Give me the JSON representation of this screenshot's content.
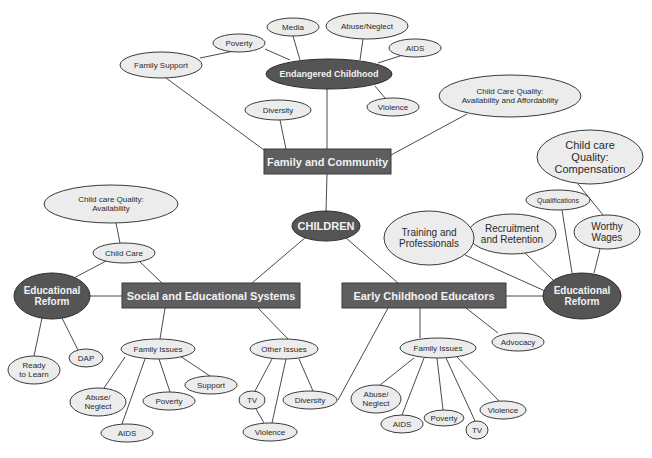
{
  "colors": {
    "background": "#ffffff",
    "light_node_fill": "#ececec",
    "dark_node_fill": "#555556",
    "box_fill": "#5e5e60",
    "edge": "#4a4a4a"
  },
  "nodes": [
    {
      "id": "children",
      "lines": [
        "CHILDREN"
      ],
      "shape": "ellipse-dark",
      "cx": 326,
      "cy": 226,
      "rx": 34,
      "ry": 15,
      "fs": 11
    },
    {
      "id": "family_community",
      "lines": [
        "Family and Community"
      ],
      "shape": "box",
      "x": 264,
      "y": 149,
      "w": 127,
      "h": 25,
      "fs": 11
    },
    {
      "id": "social_edu",
      "lines": [
        "Social and Educational Systems"
      ],
      "shape": "box",
      "x": 122,
      "y": 283,
      "w": 178,
      "h": 25,
      "fs": 11
    },
    {
      "id": "ecе",
      "lines": [
        "Early Childhood Educators"
      ],
      "shape": "box",
      "x": 342,
      "y": 283,
      "w": 164,
      "h": 25,
      "fs": 11
    },
    {
      "id": "endangered",
      "lines": [
        "Endangered Childhood"
      ],
      "shape": "ellipse-dark",
      "cx": 329,
      "cy": 74,
      "rx": 63,
      "ry": 15,
      "fs": 9
    },
    {
      "id": "media",
      "lines": [
        "Media"
      ],
      "shape": "ellipse-light",
      "cx": 293,
      "cy": 27,
      "rx": 26,
      "ry": 9,
      "fs": 8
    },
    {
      "id": "abuse_top",
      "lines": [
        "Abuse/Neglect"
      ],
      "shape": "ellipse-light",
      "cx": 367,
      "cy": 26,
      "rx": 41,
      "ry": 13,
      "fs": 8
    },
    {
      "id": "aids_top",
      "lines": [
        "AIDS"
      ],
      "shape": "ellipse-light",
      "cx": 415,
      "cy": 48,
      "rx": 26,
      "ry": 9,
      "fs": 8
    },
    {
      "id": "poverty_top",
      "lines": [
        "Poverty"
      ],
      "shape": "ellipse-light",
      "cx": 239,
      "cy": 43,
      "rx": 26,
      "ry": 9,
      "fs": 8
    },
    {
      "id": "family_support",
      "lines": [
        "Family Support"
      ],
      "shape": "ellipse-light",
      "cx": 161,
      "cy": 65,
      "rx": 41,
      "ry": 13,
      "fs": 8
    },
    {
      "id": "violence_top",
      "lines": [
        "Violence"
      ],
      "shape": "ellipse-light",
      "cx": 393,
      "cy": 107,
      "rx": 26,
      "ry": 9,
      "fs": 8
    },
    {
      "id": "diversity_top",
      "lines": [
        "Diversity"
      ],
      "shape": "ellipse-light",
      "cx": 278,
      "cy": 110,
      "rx": 33,
      "ry": 10,
      "fs": 8
    },
    {
      "id": "ccq_afford",
      "lines": [
        "Child Care Quality:",
        "Availability and Affordability"
      ],
      "shape": "ellipse-light",
      "cx": 510,
      "cy": 96,
      "rx": 71,
      "ry": 21,
      "fs": 8
    },
    {
      "id": "ccq_comp",
      "lines": [
        "Child care",
        "Quality:",
        "Compensation"
      ],
      "shape": "ellipse-light",
      "cx": 590,
      "cy": 157,
      "rx": 53,
      "ry": 27,
      "fs": 11
    },
    {
      "id": "qualifications",
      "lines": [
        "Qualifications"
      ],
      "shape": "ellipse-light",
      "cx": 558,
      "cy": 200,
      "rx": 32,
      "ry": 10,
      "fs": 7
    },
    {
      "id": "worthy_wages",
      "lines": [
        "Worthy",
        "Wages"
      ],
      "shape": "ellipse-light",
      "cx": 607,
      "cy": 232,
      "rx": 33,
      "ry": 17,
      "fs": 10
    },
    {
      "id": "recruitment",
      "lines": [
        "Recruitment",
        "and Retention"
      ],
      "shape": "ellipse-light",
      "cx": 512,
      "cy": 234,
      "rx": 44,
      "ry": 20,
      "fs": 10
    },
    {
      "id": "training",
      "lines": [
        "Training and",
        "Professionals"
      ],
      "shape": "ellipse-light",
      "cx": 429,
      "cy": 238,
      "rx": 45,
      "ry": 27,
      "fs": 10
    },
    {
      "id": "edreform_right",
      "lines": [
        "Educational",
        "Reform"
      ],
      "shape": "ellipse-dark",
      "cx": 582,
      "cy": 296,
      "rx": 39,
      "ry": 23,
      "fs": 10
    },
    {
      "id": "advocacy",
      "lines": [
        "Advocacy"
      ],
      "shape": "ellipse-light",
      "cx": 518,
      "cy": 342,
      "rx": 26,
      "ry": 9,
      "fs": 8
    },
    {
      "id": "ccq_avail",
      "lines": [
        "Child care Quality:",
        "Availability"
      ],
      "shape": "ellipse-light",
      "cx": 111,
      "cy": 204,
      "rx": 67,
      "ry": 19,
      "fs": 8
    },
    {
      "id": "child_care",
      "lines": [
        "Child Care"
      ],
      "shape": "ellipse-light",
      "cx": 124,
      "cy": 253,
      "rx": 31,
      "ry": 10,
      "fs": 8
    },
    {
      "id": "edreform_left",
      "lines": [
        "Educational",
        "Reform"
      ],
      "shape": "ellipse-dark",
      "cx": 52,
      "cy": 296,
      "rx": 38,
      "ry": 23,
      "fs": 10
    },
    {
      "id": "ready",
      "lines": [
        "Ready",
        "to Learn"
      ],
      "shape": "ellipse-light",
      "cx": 34,
      "cy": 370,
      "rx": 26,
      "ry": 14,
      "fs": 8
    },
    {
      "id": "dap",
      "lines": [
        "DAP"
      ],
      "shape": "ellipse-light",
      "cx": 86,
      "cy": 358,
      "rx": 17,
      "ry": 9,
      "fs": 8
    },
    {
      "id": "family_issues_l",
      "lines": [
        "Family Issues"
      ],
      "shape": "ellipse-light",
      "cx": 158,
      "cy": 349,
      "rx": 37,
      "ry": 10,
      "fs": 8
    },
    {
      "id": "abuse_l",
      "lines": [
        "Abuse/",
        "Neglect"
      ],
      "shape": "ellipse-light",
      "cx": 98,
      "cy": 402,
      "rx": 28,
      "ry": 14,
      "fs": 8
    },
    {
      "id": "poverty_l",
      "lines": [
        "Poverty"
      ],
      "shape": "ellipse-light",
      "cx": 169,
      "cy": 401,
      "rx": 26,
      "ry": 9,
      "fs": 8
    },
    {
      "id": "support_l",
      "lines": [
        "Support"
      ],
      "shape": "ellipse-light",
      "cx": 211,
      "cy": 385,
      "rx": 26,
      "ry": 9,
      "fs": 8
    },
    {
      "id": "aids_l",
      "lines": [
        "AIDS"
      ],
      "shape": "ellipse-light",
      "cx": 127,
      "cy": 433,
      "rx": 26,
      "ry": 9,
      "fs": 8
    },
    {
      "id": "other_issues",
      "lines": [
        "Other Issues"
      ],
      "shape": "ellipse-light",
      "cx": 284,
      "cy": 349,
      "rx": 34,
      "ry": 10,
      "fs": 8
    },
    {
      "id": "tv_l",
      "lines": [
        "TV"
      ],
      "shape": "ellipse-light",
      "cx": 252,
      "cy": 400,
      "rx": 13,
      "ry": 9,
      "fs": 8
    },
    {
      "id": "diversity_l",
      "lines": [
        "Diversity"
      ],
      "shape": "ellipse-light",
      "cx": 310,
      "cy": 400,
      "rx": 27,
      "ry": 9,
      "fs": 8
    },
    {
      "id": "violence_l",
      "lines": [
        "Violence"
      ],
      "shape": "ellipse-light",
      "cx": 270,
      "cy": 432,
      "rx": 27,
      "ry": 9,
      "fs": 8
    },
    {
      "id": "family_issues_r",
      "lines": [
        "Family Issues"
      ],
      "shape": "ellipse-light",
      "cx": 438,
      "cy": 348,
      "rx": 38,
      "ry": 10,
      "fs": 8
    },
    {
      "id": "abuse_r",
      "lines": [
        "Abuse/",
        "Neglect"
      ],
      "shape": "ellipse-light",
      "cx": 376,
      "cy": 399,
      "rx": 25,
      "ry": 14,
      "fs": 8
    },
    {
      "id": "aids_r",
      "lines": [
        "AIDS"
      ],
      "shape": "ellipse-light",
      "cx": 402,
      "cy": 424,
      "rx": 21,
      "ry": 9,
      "fs": 8
    },
    {
      "id": "poverty_r",
      "lines": [
        "Poverty"
      ],
      "shape": "ellipse-light",
      "cx": 444,
      "cy": 418,
      "rx": 20,
      "ry": 8,
      "fs": 8
    },
    {
      "id": "tv_r",
      "lines": [
        "TV"
      ],
      "shape": "ellipse-light",
      "cx": 477,
      "cy": 430,
      "rx": 11,
      "ry": 9,
      "fs": 8
    },
    {
      "id": "violence_r",
      "lines": [
        "Violence"
      ],
      "shape": "ellipse-light",
      "cx": 503,
      "cy": 410,
      "rx": 23,
      "ry": 9,
      "fs": 8
    }
  ],
  "edges": [
    [
      326,
      211,
      327,
      174
    ],
    [
      327,
      149,
      327,
      89
    ],
    [
      290,
      60,
      265,
      49
    ],
    [
      300,
      60,
      293,
      36
    ],
    [
      360,
      60,
      363,
      39
    ],
    [
      378,
      63,
      403,
      55
    ],
    [
      375,
      86,
      385,
      98
    ],
    [
      263,
      45,
      200,
      58
    ],
    [
      166,
      78,
      264,
      150
    ],
    [
      280,
      120,
      286,
      149
    ],
    [
      467,
      114,
      391,
      155
    ],
    [
      306,
      237,
      252,
      283
    ],
    [
      346,
      238,
      398,
      283
    ],
    [
      88,
      296,
      122,
      296
    ],
    [
      116,
      223,
      120,
      243
    ],
    [
      108,
      260,
      72,
      279
    ],
    [
      140,
      262,
      162,
      283
    ],
    [
      42,
      318,
      34,
      356
    ],
    [
      62,
      318,
      78,
      350
    ],
    [
      165,
      308,
      160,
      339
    ],
    [
      125,
      357,
      104,
      388
    ],
    [
      145,
      359,
      122,
      424
    ],
    [
      159,
      359,
      170,
      392
    ],
    [
      180,
      356,
      210,
      376
    ],
    [
      258,
      308,
      288,
      339
    ],
    [
      272,
      359,
      255,
      391
    ],
    [
      286,
      359,
      272,
      423
    ],
    [
      299,
      359,
      313,
      391
    ],
    [
      256,
      409,
      264,
      423
    ],
    [
      338,
      400,
      388,
      308
    ],
    [
      506,
      296,
      543,
      296
    ],
    [
      465,
      255,
      545,
      291
    ],
    [
      525,
      253,
      553,
      280
    ],
    [
      562,
      210,
      572,
      273
    ],
    [
      600,
      249,
      594,
      273
    ],
    [
      578,
      184,
      603,
      215
    ],
    [
      466,
      308,
      498,
      333
    ],
    [
      420,
      308,
      420,
      338
    ],
    [
      414,
      358,
      380,
      385
    ],
    [
      424,
      358,
      402,
      415
    ],
    [
      437,
      358,
      443,
      410
    ],
    [
      446,
      358,
      475,
      421
    ],
    [
      457,
      357,
      499,
      401
    ]
  ]
}
